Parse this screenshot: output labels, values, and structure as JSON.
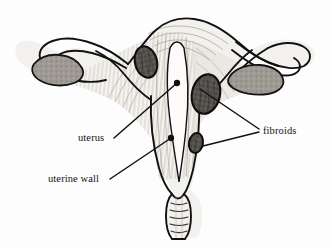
{
  "figure": {
    "background_color": "#fdfdfd",
    "ink_color": "#111111",
    "width": 331,
    "height": 247
  },
  "labels": [
    {
      "id": "uterus",
      "text": "uterus",
      "x": 78,
      "y": 141,
      "anchor": "start",
      "leader": {
        "from_x": 114,
        "from_y": 138,
        "to_x": 177,
        "to_y": 83,
        "dot_r": 2.2
      }
    },
    {
      "id": "uterine-wall",
      "text": "uterine wall",
      "x": 48,
      "y": 182,
      "anchor": "start",
      "leader": {
        "from_x": 110,
        "from_y": 179,
        "to_x": 171,
        "to_y": 138,
        "dot_r": 2.2
      }
    },
    {
      "id": "fibroids",
      "text": "fibroids",
      "x": 263,
      "y": 134,
      "anchor": "start",
      "leaders": [
        {
          "from_x": 259,
          "from_y": 130,
          "to_x": 199,
          "to_y": 88,
          "dot_r": 0
        },
        {
          "from_x": 259,
          "from_y": 133,
          "to_x": 202,
          "to_y": 145,
          "dot_r": 0
        }
      ]
    }
  ],
  "structures": {
    "ovaries": [
      {
        "id": "left-ovary",
        "cx": 57,
        "cy": 70,
        "fill": "#9a968f"
      },
      {
        "id": "right-ovary",
        "cx": 255,
        "cy": 83,
        "fill": "#95918a"
      }
    ],
    "fibroids": [
      {
        "id": "fibroid-upper-left",
        "cx": 146,
        "cy": 62,
        "rx": 11,
        "ry": 16,
        "fill": "#55514c"
      },
      {
        "id": "fibroid-right-large",
        "cx": 206,
        "cy": 94,
        "rx": 14,
        "ry": 20,
        "fill": "#4e4a45"
      },
      {
        "id": "fibroid-lower-small",
        "cx": 196,
        "cy": 143,
        "rx": 7,
        "ry": 10,
        "fill": "#4a4641"
      }
    ],
    "tissue_fill": "#f3f1ed",
    "cavity_fill": "#fbfaf8",
    "muscle_shade": "#ded9d2"
  }
}
